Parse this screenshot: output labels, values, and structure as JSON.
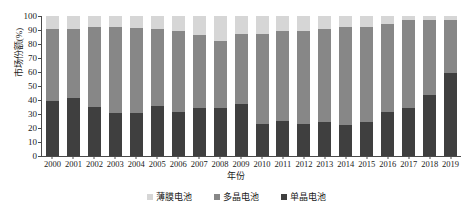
{
  "chart_data": {
    "type": "bar",
    "stacked": true,
    "title": "",
    "xlabel": "年份",
    "ylabel": "市场份额(%)",
    "ylim": [
      0,
      100
    ],
    "ytick_step": 10,
    "yticks": [
      100,
      90,
      80,
      70,
      60,
      50,
      40,
      30,
      20,
      10,
      0
    ],
    "grid": false,
    "legend_position": "bottom",
    "categories": [
      "2000",
      "2001",
      "2002",
      "2003",
      "2004",
      "2005",
      "2006",
      "2007",
      "2008",
      "2009",
      "2010",
      "2011",
      "2012",
      "2013",
      "2014",
      "2015",
      "2016",
      "2017",
      "2018",
      "2019"
    ],
    "series": [
      {
        "name": "单晶电池",
        "color": "#3f3f3f",
        "stack_order": 0,
        "values": [
          39.5,
          41.5,
          35.0,
          30.5,
          30.5,
          35.5,
          31.5,
          34.0,
          34.0,
          37.0,
          23.0,
          25.0,
          23.0,
          24.5,
          22.5,
          24.5,
          31.5,
          34.5,
          43.5,
          59.0
        ]
      },
      {
        "name": "多晶电池",
        "color": "#878787",
        "stack_order": 1,
        "values": [
          51.0,
          49.5,
          57.5,
          62.0,
          61.0,
          55.0,
          57.5,
          52.5,
          48.5,
          50.0,
          64.0,
          64.5,
          66.5,
          66.0,
          69.5,
          67.5,
          63.0,
          62.5,
          53.5,
          38.0
        ]
      },
      {
        "name": "薄膜电池",
        "color": "#d6d6d6",
        "stack_order": 2,
        "values": [
          9.5,
          9.0,
          7.5,
          7.5,
          8.5,
          9.5,
          11.0,
          13.5,
          17.5,
          13.0,
          13.0,
          10.5,
          10.5,
          9.5,
          8.0,
          8.0,
          5.5,
          3.0,
          3.0,
          3.0
        ]
      }
    ],
    "cumulative_tops": {
      "mono": [
        39.5,
        41.5,
        35.0,
        30.5,
        30.5,
        35.5,
        31.5,
        34.0,
        34.0,
        37.0,
        23.0,
        25.0,
        23.0,
        24.5,
        22.5,
        24.5,
        31.5,
        34.5,
        43.5,
        59.0
      ],
      "mono_plus_poly": [
        90.5,
        91.0,
        92.5,
        92.5,
        91.5,
        90.5,
        89.0,
        86.5,
        82.5,
        87.0,
        87.0,
        89.5,
        89.5,
        90.5,
        92.0,
        92.0,
        94.5,
        97.0,
        97.0,
        97.0
      ]
    }
  },
  "legend": {
    "items": [
      {
        "label": "薄膜电池",
        "color": "#d6d6d6"
      },
      {
        "label": "多晶电池",
        "color": "#878787"
      },
      {
        "label": "单晶电池",
        "color": "#3f3f3f"
      }
    ]
  },
  "axes": {
    "y_title": "市场份额(%)",
    "x_title": "年份"
  },
  "colors": {
    "axis": "#4a4a4a",
    "text": "#1a1a1a",
    "background": "#ffffff"
  }
}
